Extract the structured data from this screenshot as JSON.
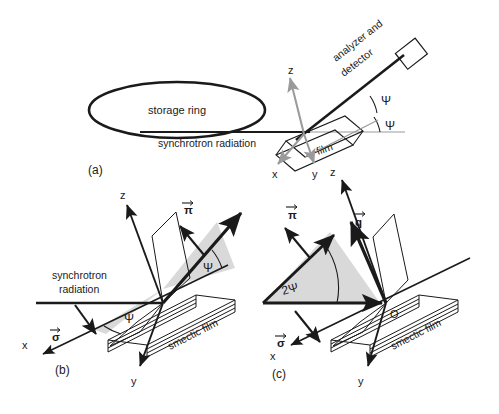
{
  "figure": {
    "background": "#ffffff",
    "ink": "#1a1a1a",
    "gray_axis": "#9a9a9a",
    "wedge_fill": "#d9d9d9"
  },
  "panels": [
    {
      "id": "a",
      "label": "(a)",
      "texts": {
        "storage_ring": "storage ring",
        "synchrotron_radiation": "synchrotron radiation",
        "analyzer_detector_line1": "analyzer and",
        "analyzer_detector_line2": "detector",
        "film": "film",
        "angle_upper": "Ψ",
        "angle_lower": "Ψ",
        "axis_z": "z",
        "axis_x": "x",
        "axis_y": "y"
      }
    },
    {
      "id": "b",
      "label": "(b)",
      "texts": {
        "synchrotron_line1": "synchrotron",
        "synchrotron_line2": "radiation",
        "smectic_film": "smectic film",
        "vec_sigma": "σ",
        "vec_pi": "π",
        "angle_in": "Ψ",
        "angle_out": "Ψ",
        "axis_z": "z",
        "axis_x": "x",
        "axis_y": "y"
      }
    },
    {
      "id": "c",
      "label": "(c)",
      "texts": {
        "smectic_film": "smectic film",
        "vec_sigma": "σ",
        "vec_pi": "π",
        "vec_q": "q",
        "angle_two_psi": "2Ψ",
        "origin": "O",
        "axis_z": "z",
        "axis_x": "x",
        "axis_y": "y"
      }
    }
  ]
}
